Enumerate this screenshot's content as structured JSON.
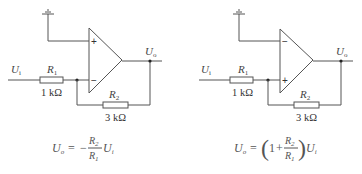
{
  "circuits": [
    {
      "name": "inverting-amplifier",
      "input_label": "U",
      "input_sub": "i",
      "output_label": "U",
      "output_sub": "o",
      "top_input_sign": "+",
      "bottom_input_sign": "−",
      "r1": {
        "name": "R",
        "sub": "1",
        "value": "1 kΩ"
      },
      "r2": {
        "name": "R",
        "sub": "2",
        "value": "3 kΩ"
      },
      "formula": {
        "lhs": "U",
        "lhs_sub": "o",
        "eq": "=",
        "prefix": "−",
        "num": "R",
        "num_sub": "2",
        "den": "R",
        "den_sub": "1",
        "tail": "U",
        "tail_sub": "i"
      }
    },
    {
      "name": "non-inverting-amplifier",
      "input_label": "U",
      "input_sub": "i",
      "output_label": "U",
      "output_sub": "o",
      "top_input_sign": "−",
      "bottom_input_sign": "+",
      "r1": {
        "name": "R",
        "sub": "1",
        "value": "1 kΩ"
      },
      "r2": {
        "name": "R",
        "sub": "2",
        "value": "3 kΩ"
      },
      "formula": {
        "lhs": "U",
        "lhs_sub": "o",
        "eq": "=",
        "lparen": "(",
        "one": "1",
        "plus": "+",
        "num": "R",
        "num_sub": "2",
        "den": "R",
        "den_sub": "1",
        "rparen": ")",
        "tail": "U",
        "tail_sub": "i"
      }
    }
  ]
}
